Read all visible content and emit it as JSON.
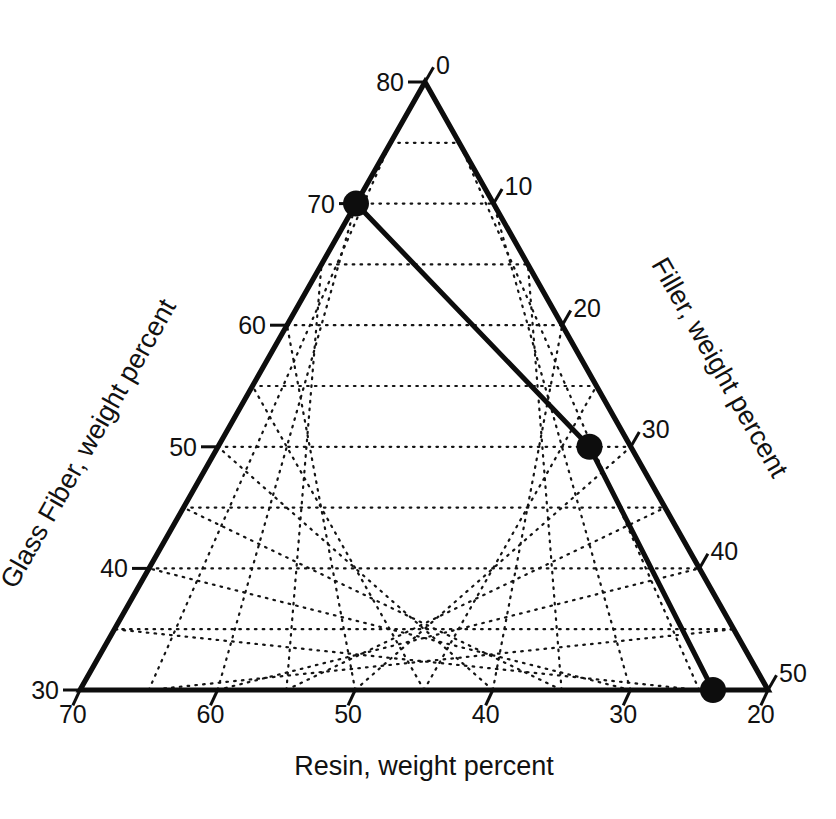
{
  "chart_data": {
    "type": "scatter",
    "plot_kind": "ternary-diagram",
    "title": "",
    "axes": {
      "left": {
        "name": "Glass Fiber",
        "title": "Glass Fiber, weight percent",
        "unit": "weight percent",
        "tick_labels": [
          "80",
          "70",
          "60",
          "50",
          "40",
          "30"
        ],
        "tick_values": [
          80,
          70,
          60,
          50,
          40,
          30
        ],
        "range": [
          30,
          80
        ],
        "major_step": 10,
        "grid_step": 5
      },
      "right": {
        "name": "Filler",
        "title": "Filler, weight percent",
        "unit": "weight percent",
        "tick_labels": [
          "0",
          "10",
          "20",
          "30",
          "40",
          "50"
        ],
        "tick_values": [
          0,
          10,
          20,
          30,
          40,
          50
        ],
        "range": [
          0,
          50
        ],
        "major_step": 10,
        "grid_step": 5
      },
      "bottom": {
        "name": "Resin",
        "title": "Resin, weight percent",
        "unit": "weight percent",
        "tick_labels": [
          "70",
          "60",
          "50",
          "40",
          "30",
          "20"
        ],
        "tick_values": [
          70,
          60,
          50,
          40,
          30,
          20
        ],
        "range": [
          20,
          70
        ],
        "major_step": 10,
        "grid_step": 5
      }
    },
    "grid": "on",
    "grid_style": "dotted",
    "legend": "none",
    "points": [
      {
        "label": "P1",
        "glass_fiber": 70,
        "resin": 30,
        "filler": 0,
        "u": 0.0
      },
      {
        "label": "P2",
        "glass_fiber": 50,
        "resin": 23,
        "filler": 27,
        "u": 0.535
      },
      {
        "label": "P3",
        "glass_fiber": 30,
        "resin": 24,
        "filler": 46,
        "u": 1.0
      }
    ],
    "series": [
      {
        "name": "tie-line",
        "style": "solid",
        "connects": [
          "P1",
          "P2",
          "P3"
        ]
      }
    ],
    "colors": {
      "axis": "#0d0d0d",
      "grid": "#141414",
      "data": "#0d0d0d",
      "background": "#ffffff"
    }
  },
  "geometry": {
    "apex": {
      "x": 425,
      "y": 82
    },
    "bottom_left": {
      "x": 80,
      "y": 690
    },
    "bottom_right": {
      "x": 768,
      "y": 690
    },
    "divisions": 10
  },
  "labels": {
    "left_axis_title": "Glass Fiber, weight percent",
    "right_axis_title": "Filler, weight percent",
    "bottom_axis_title": "Resin, weight percent",
    "left_ticks": [
      "80",
      "70",
      "60",
      "50",
      "40",
      "30"
    ],
    "right_ticks": [
      "0",
      "10",
      "20",
      "30",
      "40",
      "50"
    ],
    "bottom_ticks": [
      "70",
      "60",
      "50",
      "40",
      "30",
      "20"
    ]
  }
}
